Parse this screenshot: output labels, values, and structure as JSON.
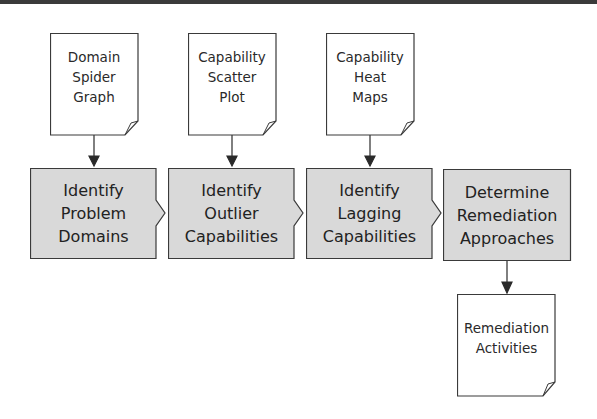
{
  "colors": {
    "process_fill": "#d9d9d9",
    "stroke": "#3a3a3a",
    "document_fill": "#ffffff"
  },
  "inputs": [
    {
      "lines": [
        "Domain",
        "Spider",
        "Graph"
      ]
    },
    {
      "lines": [
        "Capability",
        "Scatter",
        "Plot"
      ]
    },
    {
      "lines": [
        "Capability",
        "Heat",
        "Maps"
      ]
    }
  ],
  "steps": [
    {
      "lines": [
        "Identify",
        "Problem",
        "Domains"
      ]
    },
    {
      "lines": [
        "Identify",
        "Outlier",
        "Capabilities"
      ]
    },
    {
      "lines": [
        "Identify",
        "Lagging",
        "Capabilities"
      ]
    },
    {
      "lines": [
        "Determine",
        "Remediation",
        "Approaches"
      ]
    }
  ],
  "output": {
    "lines": [
      "Remediation",
      "Activities"
    ]
  }
}
